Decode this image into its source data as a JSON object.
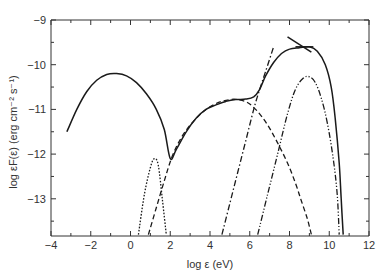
{
  "chart_data": {
    "type": "line",
    "title": "",
    "xlabel": "log ε (eV)",
    "ylabel": "log εF(ε) (erg cm⁻² s⁻¹)",
    "xlim": [
      -4,
      12
    ],
    "ylim": [
      -13.8,
      -8.8
    ],
    "grid": false,
    "legend": null,
    "x_ticks": [
      -4,
      -2,
      0,
      2,
      4,
      6,
      8,
      10,
      12
    ],
    "x_tick_labels": [
      "−4",
      "−2",
      "0",
      "2",
      "4",
      "6",
      "8",
      "10",
      "12"
    ],
    "y_ticks": [
      -9,
      -10,
      -11,
      -12,
      -13
    ],
    "y_tick_labels": [
      "−9",
      "−10",
      "−11",
      "−12",
      "−13"
    ],
    "series": [
      {
        "name": "total",
        "style": "solid",
        "x": [
          -3.2,
          -2.7,
          -2.2,
          -1.7,
          -1.2,
          -0.7,
          -0.2,
          0.3,
          0.8,
          1.3,
          1.7,
          2.0,
          2.3,
          2.8,
          3.3,
          3.8,
          4.3,
          4.8,
          5.3,
          5.8,
          6.2,
          6.5,
          6.8,
          7.2,
          7.6,
          8.0,
          8.5,
          9.0,
          9.4,
          9.8,
          10.1,
          10.3,
          10.5,
          10.6,
          10.7
        ],
        "y": [
          -11.5,
          -11.0,
          -10.6,
          -10.35,
          -10.22,
          -10.2,
          -10.25,
          -10.4,
          -10.65,
          -11.0,
          -11.45,
          -12.1,
          -11.9,
          -11.5,
          -11.2,
          -11.0,
          -10.9,
          -10.82,
          -10.78,
          -10.77,
          -10.72,
          -10.55,
          -10.25,
          -9.95,
          -9.75,
          -9.65,
          -9.62,
          -9.6,
          -9.7,
          -10.0,
          -10.5,
          -11.2,
          -12.2,
          -13.0,
          -13.8
        ]
      },
      {
        "name": "dotted-narrow",
        "style": "dotted",
        "x": [
          0.4,
          0.7,
          1.0,
          1.2,
          1.4,
          1.6,
          1.8
        ],
        "y": [
          -13.8,
          -12.9,
          -12.3,
          -12.1,
          -12.25,
          -13.0,
          -13.8
        ]
      },
      {
        "name": "dashed",
        "style": "dashed",
        "x": [
          0.9,
          1.3,
          1.7,
          2.1,
          2.6,
          3.2,
          3.8,
          4.4,
          5.0,
          5.4,
          5.9,
          6.4,
          6.9,
          7.4,
          7.9,
          8.3,
          8.6,
          8.9,
          9.1
        ],
        "y": [
          -13.8,
          -13.2,
          -12.6,
          -12.05,
          -11.6,
          -11.25,
          -11.0,
          -10.85,
          -10.78,
          -10.78,
          -10.85,
          -11.05,
          -11.35,
          -11.75,
          -12.2,
          -12.65,
          -13.05,
          -13.45,
          -13.8
        ]
      },
      {
        "name": "dash-dot",
        "style": "dashdot",
        "x": [
          4.6,
          5.0,
          5.4,
          5.8,
          6.2,
          6.5,
          6.8,
          7.2
        ],
        "y": [
          -13.8,
          -13.1,
          -12.4,
          -11.7,
          -11.0,
          -10.55,
          -10.15,
          -9.6
        ]
      },
      {
        "name": "dash-dot-dot",
        "style": "dashdotdot",
        "x": [
          6.4,
          6.9,
          7.4,
          7.9,
          8.3,
          8.7,
          9.0,
          9.3,
          9.6,
          9.9,
          10.2,
          10.4,
          10.5
        ],
        "y": [
          -13.8,
          -12.9,
          -12.0,
          -11.1,
          -10.55,
          -10.3,
          -10.27,
          -10.4,
          -10.75,
          -11.3,
          -12.1,
          -12.9,
          -13.8
        ]
      },
      {
        "name": "power-law-segment",
        "style": "solid",
        "x": [
          7.9,
          9.1
        ],
        "y": [
          -9.38,
          -9.72
        ]
      },
      {
        "name": "flat-segment",
        "style": "solid",
        "x": [
          8.3,
          9.2
        ],
        "y": [
          -9.6,
          -9.6
        ]
      }
    ]
  }
}
